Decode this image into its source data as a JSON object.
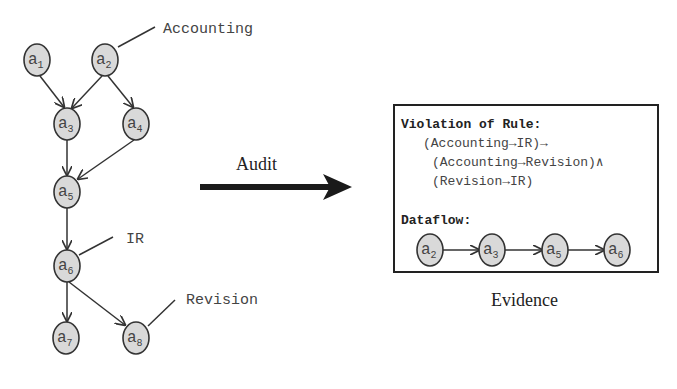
{
  "graph": {
    "nodes": [
      {
        "id": "a1",
        "base": "a",
        "sub": "1",
        "x": 37,
        "y": 60
      },
      {
        "id": "a2",
        "base": "a",
        "sub": "2",
        "x": 105,
        "y": 60
      },
      {
        "id": "a3",
        "base": "a",
        "sub": "3",
        "x": 67,
        "y": 124
      },
      {
        "id": "a4",
        "base": "a",
        "sub": "4",
        "x": 136,
        "y": 124
      },
      {
        "id": "a5",
        "base": "a",
        "sub": "5",
        "x": 67,
        "y": 192
      },
      {
        "id": "a6",
        "base": "a",
        "sub": "6",
        "x": 67,
        "y": 266
      },
      {
        "id": "a7",
        "base": "a",
        "sub": "7",
        "x": 66,
        "y": 338
      },
      {
        "id": "a8",
        "base": "a",
        "sub": "8",
        "x": 136,
        "y": 338
      }
    ],
    "edges": [
      [
        "a1",
        "a3"
      ],
      [
        "a2",
        "a3"
      ],
      [
        "a2",
        "a4"
      ],
      [
        "a3",
        "a5"
      ],
      [
        "a4",
        "a5"
      ],
      [
        "a5",
        "a6"
      ],
      [
        "a6",
        "a7"
      ],
      [
        "a6",
        "a8"
      ]
    ],
    "labels": {
      "accounting": "Accounting",
      "ir": "IR",
      "revision": "Revision"
    }
  },
  "audit": {
    "label": "Audit"
  },
  "evidence": {
    "caption": "Evidence",
    "rule_title": "Violation of Rule:",
    "rule_lines": [
      "(Accounting→IR)→",
      "(Accounting→Revision)∧",
      "(Revision→IR)"
    ],
    "dataflow_title": "Dataflow:",
    "dataflow": [
      {
        "base": "a",
        "sub": "2"
      },
      {
        "base": "a",
        "sub": "3"
      },
      {
        "base": "a",
        "sub": "5"
      },
      {
        "base": "a",
        "sub": "6"
      }
    ]
  }
}
